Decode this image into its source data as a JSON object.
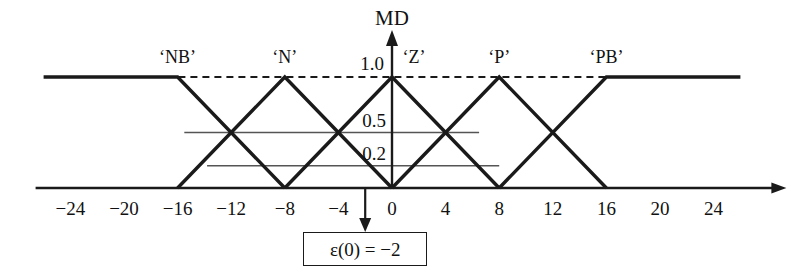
{
  "figure": {
    "axis_title_y": "MD",
    "y_ticks": [
      {
        "label": "1.0",
        "value": 1.0
      },
      {
        "label": "0.5",
        "value": 0.5
      },
      {
        "label": "0.2",
        "value": 0.2
      }
    ],
    "x_ticks": [
      {
        "label": "−24",
        "value": -24
      },
      {
        "label": "−20",
        "value": -20
      },
      {
        "label": "−16",
        "value": -16
      },
      {
        "label": "−12",
        "value": -12
      },
      {
        "label": "−8",
        "value": -8
      },
      {
        "label": "−4",
        "value": -4
      },
      {
        "label": "0",
        "value": 0
      },
      {
        "label": "4",
        "value": 4
      },
      {
        "label": "8",
        "value": 8
      },
      {
        "label": "12",
        "value": 12
      },
      {
        "label": "16",
        "value": 16
      },
      {
        "label": "20",
        "value": 20
      },
      {
        "label": "24",
        "value": 24
      }
    ],
    "set_labels": [
      {
        "name": "NB",
        "text": "‘NB’",
        "peak": -16
      },
      {
        "name": "N",
        "text": "‘N’",
        "peak": -8
      },
      {
        "name": "Z",
        "text": "‘Z’",
        "peak": 0
      },
      {
        "name": "P",
        "text": "‘P’",
        "peak": 8
      },
      {
        "name": "PB",
        "text": "‘PB’",
        "peak": 16
      }
    ],
    "annotation": {
      "box_text": "ε(0) = −2",
      "pointer_value": -2
    },
    "colors": {
      "line": "#1a1a1a",
      "guide": "#555555",
      "background": "#ffffff"
    }
  },
  "chart_data": {
    "type": "line",
    "title": "",
    "xlabel": "",
    "ylabel": "MD",
    "xlim": [
      -26,
      26
    ],
    "ylim": [
      0,
      1.05
    ],
    "grid": false,
    "legend": "none",
    "x": [
      -24,
      -20,
      -16,
      -12,
      -8,
      -4,
      0,
      4,
      8,
      12,
      16,
      20,
      24
    ],
    "series": [
      {
        "name": "'NB'",
        "kind": "triangular-membership",
        "peak": -16,
        "left_foot": -24,
        "right_foot": -8,
        "saturates_left": true,
        "points": [
          [
            -26,
            1.0
          ],
          [
            -24,
            1.0
          ],
          [
            -16,
            1.0
          ],
          [
            -8,
            0.0
          ]
        ]
      },
      {
        "name": "'N'",
        "kind": "triangular-membership",
        "peak": -8,
        "left_foot": -16,
        "right_foot": 0,
        "points": [
          [
            -16,
            0.0
          ],
          [
            -8,
            1.0
          ],
          [
            0,
            0.0
          ]
        ]
      },
      {
        "name": "'Z'",
        "kind": "triangular-membership",
        "peak": 0,
        "left_foot": -8,
        "right_foot": 8,
        "points": [
          [
            -8,
            0.0
          ],
          [
            0,
            1.0
          ],
          [
            8,
            0.0
          ]
        ]
      },
      {
        "name": "'P'",
        "kind": "triangular-membership",
        "peak": 8,
        "left_foot": 0,
        "right_foot": 16,
        "points": [
          [
            0,
            0.0
          ],
          [
            8,
            1.0
          ],
          [
            16,
            0.0
          ]
        ]
      },
      {
        "name": "'PB'",
        "kind": "triangular-membership",
        "peak": 16,
        "left_foot": 8,
        "right_foot": 24,
        "saturates_right": true,
        "points": [
          [
            8,
            0.0
          ],
          [
            16,
            1.0
          ],
          [
            24,
            1.0
          ],
          [
            26,
            1.0
          ]
        ]
      }
    ],
    "guide_lines": [
      {
        "label": "1.0",
        "y": 1.0,
        "style": "dashed",
        "x_from": -24,
        "x_to": 24
      },
      {
        "label": "0.5",
        "y": 0.5,
        "style": "solid-thin",
        "x_from": -15.5,
        "x_to": 6.5
      },
      {
        "label": "0.2",
        "y": 0.2,
        "style": "solid-thin",
        "x_from": -13.8,
        "x_to": 8.0
      }
    ],
    "annotations": [
      {
        "text": "ε(0) = −2",
        "x": -2,
        "y": 0,
        "kind": "boxed-arrow-down"
      }
    ]
  }
}
